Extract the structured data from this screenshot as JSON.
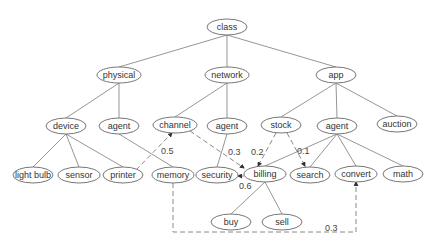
{
  "diagram": {
    "type": "hierarchy-tree",
    "nodes": [
      {
        "id": "class",
        "label": "class",
        "x": 227,
        "y": 27,
        "rx": 20
      },
      {
        "id": "physical",
        "label": "physical",
        "x": 119,
        "y": 75,
        "rx": 22
      },
      {
        "id": "network",
        "label": "network",
        "x": 227,
        "y": 75,
        "rx": 22
      },
      {
        "id": "app",
        "label": "app",
        "x": 336,
        "y": 75,
        "rx": 20
      },
      {
        "id": "device",
        "label": "device",
        "x": 66,
        "y": 126,
        "rx": 20
      },
      {
        "id": "agent1",
        "label": "agent",
        "x": 119,
        "y": 126,
        "rx": 20
      },
      {
        "id": "channel",
        "label": "channel",
        "x": 175,
        "y": 125,
        "rx": 22
      },
      {
        "id": "agent2",
        "label": "agent",
        "x": 227,
        "y": 126,
        "rx": 20
      },
      {
        "id": "stock",
        "label": "stock",
        "x": 281,
        "y": 125,
        "rx": 20
      },
      {
        "id": "agent3",
        "label": "agent",
        "x": 337,
        "y": 126,
        "rx": 20
      },
      {
        "id": "auction",
        "label": "auction",
        "x": 397,
        "y": 124,
        "rx": 20
      },
      {
        "id": "lightbulb",
        "label": "light bulb",
        "x": 33,
        "y": 175,
        "rx": 20
      },
      {
        "id": "sensor",
        "label": "sensor",
        "x": 79,
        "y": 175,
        "rx": 21
      },
      {
        "id": "printer",
        "label": "printer",
        "x": 123,
        "y": 175,
        "rx": 20
      },
      {
        "id": "memory",
        "label": "memory",
        "x": 173,
        "y": 175,
        "rx": 21
      },
      {
        "id": "security",
        "label": "security",
        "x": 217,
        "y": 175,
        "rx": 21
      },
      {
        "id": "billing",
        "label": "billing",
        "x": 265,
        "y": 174,
        "rx": 21
      },
      {
        "id": "search",
        "label": "search",
        "x": 310,
        "y": 175,
        "rx": 20
      },
      {
        "id": "convert",
        "label": "convert",
        "x": 356,
        "y": 174,
        "rx": 21
      },
      {
        "id": "math",
        "label": "math",
        "x": 403,
        "y": 174,
        "rx": 20
      },
      {
        "id": "buy",
        "label": "buy",
        "x": 231,
        "y": 222,
        "rx": 20
      },
      {
        "id": "sell",
        "label": "sell",
        "x": 282,
        "y": 222,
        "rx": 20
      }
    ],
    "edges": [
      {
        "from": "class",
        "to": "physical"
      },
      {
        "from": "class",
        "to": "network"
      },
      {
        "from": "class",
        "to": "app"
      },
      {
        "from": "physical",
        "to": "device"
      },
      {
        "from": "physical",
        "to": "agent1"
      },
      {
        "from": "network",
        "to": "channel"
      },
      {
        "from": "network",
        "to": "agent2"
      },
      {
        "from": "app",
        "to": "stock"
      },
      {
        "from": "app",
        "to": "agent3"
      },
      {
        "from": "app",
        "to": "auction"
      },
      {
        "from": "device",
        "to": "lightbulb"
      },
      {
        "from": "device",
        "to": "sensor"
      },
      {
        "from": "device",
        "to": "printer"
      },
      {
        "from": "agent1",
        "to": "memory"
      },
      {
        "from": "agent2",
        "to": "security"
      },
      {
        "from": "agent3",
        "to": "billing"
      },
      {
        "from": "agent3",
        "to": "search"
      },
      {
        "from": "agent3",
        "to": "convert"
      },
      {
        "from": "agent3",
        "to": "math"
      },
      {
        "from": "billing",
        "to": "buy"
      },
      {
        "from": "billing",
        "to": "sell"
      }
    ],
    "weighted_links": [
      {
        "from": "printer",
        "to": "channel",
        "weight": "0.5"
      },
      {
        "from": "channel",
        "to": "billing",
        "weight": "0.3"
      },
      {
        "from": "stock",
        "to": "billing",
        "weight": "0.2"
      },
      {
        "from": "stock",
        "to": "search",
        "weight": "0.1"
      },
      {
        "from": "billing",
        "to": "security",
        "weight": "0.6"
      },
      {
        "from": "memory",
        "to": "convert",
        "weight": "0.3"
      }
    ]
  }
}
